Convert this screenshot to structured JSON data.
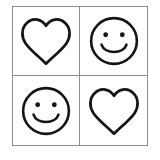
{
  "canvas": {
    "width": 160,
    "height": 160,
    "background_color": "#ffffff"
  },
  "grid": {
    "rows": 2,
    "columns": 2,
    "border_color": "#8c8c8c",
    "divider_color": "#8c8c8c",
    "cell_background": "#ffffff",
    "stroke_color": "#141414"
  },
  "cells": [
    {
      "position": "top-left",
      "icon_name": "heart-icon",
      "label": "Heart",
      "style": "outline"
    },
    {
      "position": "top-right",
      "icon_name": "smiley-face-icon",
      "label": "Smiley Face",
      "style": "outline"
    },
    {
      "position": "bottom-left",
      "icon_name": "smiley-face-icon",
      "label": "Smiley Face",
      "style": "outline"
    },
    {
      "position": "bottom-right",
      "icon_name": "heart-icon",
      "label": "Heart",
      "style": "outline"
    }
  ]
}
